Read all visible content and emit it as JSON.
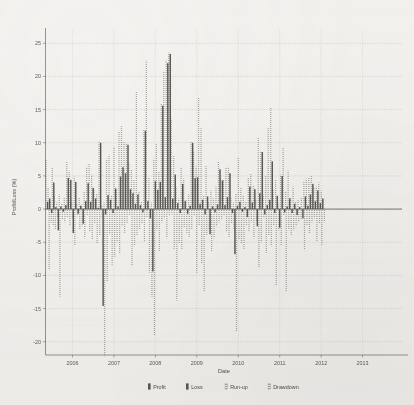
{
  "chart_data": {
    "type": "bar",
    "title": "",
    "xlabel": "Date",
    "ylabel": "Profit/Loss (%)",
    "ylim": [
      -22,
      27
    ],
    "yticks": [
      25,
      20,
      15,
      10,
      5,
      0,
      -5,
      -10,
      -15,
      -20
    ],
    "ytick_labels": [
      "25",
      "20",
      "15",
      "10",
      "5",
      "0",
      "-5",
      "-10",
      "-15",
      "-20"
    ],
    "xticks": [
      2006,
      2007,
      2008,
      2009,
      2010,
      2011,
      2012,
      2013
    ],
    "xtick_labels": [
      "2006",
      "2007",
      "2008",
      "2009",
      "2010",
      "2011",
      "2012",
      "2013"
    ],
    "xlim": [
      2005.35,
      2013.95
    ],
    "grid": true,
    "legend_position": "bottom",
    "legend": [
      {
        "name": "Profit",
        "style": "solid",
        "color": "#5a5855"
      },
      {
        "name": "Loss",
        "style": "solid",
        "color": "#5a5855"
      },
      {
        "name": "Run-up",
        "style": "hatched",
        "color": "#a8a6a2"
      },
      {
        "name": "Drawdown",
        "style": "hatched",
        "color": "#a8a6a2"
      }
    ],
    "series": [
      {
        "name": "Profit/Loss",
        "key": "pl"
      },
      {
        "name": "Run-up",
        "key": "runup"
      },
      {
        "name": "Drawdown",
        "key": "drawdown"
      }
    ],
    "points": [
      {
        "x": 2005.4,
        "pl": 1.1,
        "runup": 7.4,
        "drawdown": -9.2
      },
      {
        "x": 2005.45,
        "pl": 1.6,
        "runup": 3.2,
        "drawdown": -2.0
      },
      {
        "x": 2005.5,
        "pl": -0.6,
        "runup": 1.2,
        "drawdown": -2.4
      },
      {
        "x": 2005.55,
        "pl": 4.0,
        "runup": 6.2,
        "drawdown": -3.1
      },
      {
        "x": 2005.6,
        "pl": 0.3,
        "runup": 2.1,
        "drawdown": -1.3
      },
      {
        "x": 2005.66,
        "pl": -3.2,
        "runup": 1.0,
        "drawdown": -13.2
      },
      {
        "x": 2005.72,
        "pl": 0.4,
        "runup": 2.2,
        "drawdown": -1.6
      },
      {
        "x": 2005.78,
        "pl": -0.4,
        "runup": 0.8,
        "drawdown": -2.0
      },
      {
        "x": 2005.84,
        "pl": 0.6,
        "runup": 1.8,
        "drawdown": -1.2
      },
      {
        "x": 2005.9,
        "pl": 4.7,
        "runup": 7.2,
        "drawdown": -2.4
      },
      {
        "x": 2005.96,
        "pl": 4.4,
        "runup": 5.8,
        "drawdown": -1.4
      },
      {
        "x": 2006.02,
        "pl": -3.6,
        "runup": 1.3,
        "drawdown": -5.4
      },
      {
        "x": 2006.08,
        "pl": 4.1,
        "runup": 4.9,
        "drawdown": -1.1
      },
      {
        "x": 2006.14,
        "pl": -0.7,
        "runup": 0.9,
        "drawdown": -3.0
      },
      {
        "x": 2006.2,
        "pl": 0.5,
        "runup": 1.7,
        "drawdown": -2.6
      },
      {
        "x": 2006.26,
        "pl": -2.2,
        "runup": 0.7,
        "drawdown": -4.4
      },
      {
        "x": 2006.32,
        "pl": 1.2,
        "runup": 2.6,
        "drawdown": -1.0
      },
      {
        "x": 2006.38,
        "pl": 3.9,
        "runup": 6.4,
        "drawdown": -3.4
      },
      {
        "x": 2006.44,
        "pl": 1.1,
        "runup": 6.8,
        "drawdown": -4.6
      },
      {
        "x": 2006.5,
        "pl": 3.2,
        "runup": 5.2,
        "drawdown": -2.2
      },
      {
        "x": 2006.56,
        "pl": 1.6,
        "runup": 3.0,
        "drawdown": -5.2
      },
      {
        "x": 2006.62,
        "pl": 0.2,
        "runup": 2.4,
        "drawdown": -4.0
      },
      {
        "x": 2006.68,
        "pl": 10.0,
        "runup": 10.3,
        "drawdown": -1.4
      },
      {
        "x": 2006.74,
        "pl": -14.6,
        "runup": 0.6,
        "drawdown": -22.2
      },
      {
        "x": 2006.8,
        "pl": -0.8,
        "runup": 1.0,
        "drawdown": -11.0
      },
      {
        "x": 2006.86,
        "pl": 2.1,
        "runup": 7.6,
        "drawdown": -3.8
      },
      {
        "x": 2006.92,
        "pl": 1.4,
        "runup": 8.2,
        "drawdown": -8.4
      },
      {
        "x": 2006.98,
        "pl": -0.6,
        "runup": 2.0,
        "drawdown": -7.2
      },
      {
        "x": 2007.04,
        "pl": 3.1,
        "runup": 9.4,
        "drawdown": -5.0
      },
      {
        "x": 2007.1,
        "pl": 0.4,
        "runup": 3.1,
        "drawdown": -6.8
      },
      {
        "x": 2007.16,
        "pl": 4.9,
        "runup": 11.8,
        "drawdown": -2.6
      },
      {
        "x": 2007.22,
        "pl": 6.3,
        "runup": 12.6,
        "drawdown": -3.6
      },
      {
        "x": 2007.28,
        "pl": 5.4,
        "runup": 10.1,
        "drawdown": -2.2
      },
      {
        "x": 2007.34,
        "pl": 9.7,
        "runup": 10.0,
        "drawdown": -1.0
      },
      {
        "x": 2007.4,
        "pl": 3.0,
        "runup": 7.0,
        "drawdown": -8.6
      },
      {
        "x": 2007.46,
        "pl": 2.4,
        "runup": 6.0,
        "drawdown": -5.6
      },
      {
        "x": 2007.52,
        "pl": 0.8,
        "runup": 4.4,
        "drawdown": -4.0
      },
      {
        "x": 2007.58,
        "pl": 2.2,
        "runup": 17.8,
        "drawdown": -3.0
      },
      {
        "x": 2007.64,
        "pl": 0.6,
        "runup": 2.6,
        "drawdown": -2.2
      },
      {
        "x": 2007.7,
        "pl": -0.5,
        "runup": 1.2,
        "drawdown": -4.8
      },
      {
        "x": 2007.76,
        "pl": 11.8,
        "runup": 12.0,
        "drawdown": -1.2
      },
      {
        "x": 2007.82,
        "pl": 1.2,
        "runup": 22.4,
        "drawdown": -9.6
      },
      {
        "x": 2007.88,
        "pl": -1.4,
        "runup": 4.8,
        "drawdown": -13.2
      },
      {
        "x": 2007.94,
        "pl": -9.4,
        "runup": 1.0,
        "drawdown": -19.0
      },
      {
        "x": 2008.0,
        "pl": 4.2,
        "runup": 7.6,
        "drawdown": -3.2
      },
      {
        "x": 2008.06,
        "pl": 2.9,
        "runup": 9.8,
        "drawdown": -6.4
      },
      {
        "x": 2008.12,
        "pl": 4.1,
        "runup": 5.6,
        "drawdown": -2.0
      },
      {
        "x": 2008.18,
        "pl": 15.6,
        "runup": 16.0,
        "drawdown": -1.4
      },
      {
        "x": 2008.24,
        "pl": 1.8,
        "runup": 20.8,
        "drawdown": -4.4
      },
      {
        "x": 2008.3,
        "pl": 22.0,
        "runup": 22.4,
        "drawdown": -1.0
      },
      {
        "x": 2008.36,
        "pl": 23.4,
        "runup": 23.6,
        "drawdown": -0.8
      },
      {
        "x": 2008.42,
        "pl": 1.6,
        "runup": 13.6,
        "drawdown": -6.0
      },
      {
        "x": 2008.48,
        "pl": 5.2,
        "runup": 8.0,
        "drawdown": -13.8
      },
      {
        "x": 2008.54,
        "pl": 0.9,
        "runup": 3.4,
        "drawdown": -5.2
      },
      {
        "x": 2008.6,
        "pl": -0.6,
        "runup": 1.6,
        "drawdown": -6.0
      },
      {
        "x": 2008.66,
        "pl": 3.8,
        "runup": 6.2,
        "drawdown": -2.8
      },
      {
        "x": 2008.72,
        "pl": 1.2,
        "runup": 4.6,
        "drawdown": -3.6
      },
      {
        "x": 2008.78,
        "pl": -0.7,
        "runup": 1.4,
        "drawdown": -4.2
      },
      {
        "x": 2008.84,
        "pl": 0.5,
        "runup": 2.2,
        "drawdown": -3.0
      },
      {
        "x": 2008.9,
        "pl": 10.0,
        "runup": 10.2,
        "drawdown": -1.0
      },
      {
        "x": 2008.96,
        "pl": 4.7,
        "runup": 8.8,
        "drawdown": -9.6
      },
      {
        "x": 2009.02,
        "pl": 4.8,
        "runup": 6.4,
        "drawdown": -2.4
      },
      {
        "x": 2009.08,
        "pl": 0.8,
        "runup": 16.8,
        "drawdown": -8.2
      },
      {
        "x": 2009.14,
        "pl": 1.4,
        "runup": 12.2,
        "drawdown": -12.4
      },
      {
        "x": 2009.2,
        "pl": -0.8,
        "runup": 2.0,
        "drawdown": -4.0
      },
      {
        "x": 2009.26,
        "pl": 1.9,
        "runup": 6.6,
        "drawdown": -3.2
      },
      {
        "x": 2009.32,
        "pl": -3.8,
        "runup": 1.2,
        "drawdown": -6.4
      },
      {
        "x": 2009.38,
        "pl": 0.4,
        "runup": 2.8,
        "drawdown": -4.4
      },
      {
        "x": 2009.44,
        "pl": -0.5,
        "runup": 1.6,
        "drawdown": -2.6
      },
      {
        "x": 2009.5,
        "pl": 0.7,
        "runup": 3.4,
        "drawdown": -2.0
      },
      {
        "x": 2009.56,
        "pl": 6.0,
        "runup": 7.2,
        "drawdown": -1.6
      },
      {
        "x": 2009.62,
        "pl": 4.3,
        "runup": 4.6,
        "drawdown": -1.0
      },
      {
        "x": 2009.68,
        "pl": 0.6,
        "runup": 4.4,
        "drawdown": -3.4
      },
      {
        "x": 2009.74,
        "pl": 1.8,
        "runup": 6.2,
        "drawdown": -4.2
      },
      {
        "x": 2009.8,
        "pl": 5.4,
        "runup": 6.4,
        "drawdown": -2.2
      },
      {
        "x": 2009.86,
        "pl": -0.6,
        "runup": 1.8,
        "drawdown": -3.0
      },
      {
        "x": 2009.92,
        "pl": -6.8,
        "runup": 1.0,
        "drawdown": -18.4
      },
      {
        "x": 2009.98,
        "pl": 0.5,
        "runup": 2.4,
        "drawdown": -4.6
      },
      {
        "x": 2010.04,
        "pl": 1.1,
        "runup": 7.8,
        "drawdown": -5.2
      },
      {
        "x": 2010.1,
        "pl": -0.4,
        "runup": 3.2,
        "drawdown": -6.0
      },
      {
        "x": 2010.16,
        "pl": 0.3,
        "runup": 2.0,
        "drawdown": -2.4
      },
      {
        "x": 2010.22,
        "pl": -1.2,
        "runup": 1.2,
        "drawdown": -3.4
      },
      {
        "x": 2010.28,
        "pl": 3.4,
        "runup": 4.8,
        "drawdown": -2.0
      },
      {
        "x": 2010.34,
        "pl": 1.0,
        "runup": 5.4,
        "drawdown": -4.4
      },
      {
        "x": 2010.4,
        "pl": 3.0,
        "runup": 3.6,
        "drawdown": -1.8
      },
      {
        "x": 2010.46,
        "pl": -2.6,
        "runup": 1.4,
        "drawdown": -8.8
      },
      {
        "x": 2010.52,
        "pl": 2.4,
        "runup": 10.8,
        "drawdown": -5.0
      },
      {
        "x": 2010.58,
        "pl": 8.6,
        "runup": 8.8,
        "drawdown": -1.2
      },
      {
        "x": 2010.64,
        "pl": -0.8,
        "runup": 2.2,
        "drawdown": -6.6
      },
      {
        "x": 2010.7,
        "pl": 0.6,
        "runup": 5.0,
        "drawdown": -4.0
      },
      {
        "x": 2010.76,
        "pl": 1.4,
        "runup": 12.2,
        "drawdown": -5.6
      },
      {
        "x": 2010.82,
        "pl": 7.2,
        "runup": 15.4,
        "drawdown": -2.4
      },
      {
        "x": 2010.88,
        "pl": -0.6,
        "runup": 3.0,
        "drawdown": -11.6
      },
      {
        "x": 2010.94,
        "pl": 2.0,
        "runup": 4.4,
        "drawdown": -3.2
      },
      {
        "x": 2011.0,
        "pl": -2.8,
        "runup": 1.0,
        "drawdown": -5.4
      },
      {
        "x": 2011.06,
        "pl": 5.0,
        "runup": 5.2,
        "drawdown": -1.0
      },
      {
        "x": 2011.12,
        "pl": -0.5,
        "runup": 9.2,
        "drawdown": -12.4
      },
      {
        "x": 2011.18,
        "pl": 0.4,
        "runup": 2.6,
        "drawdown": -3.0
      },
      {
        "x": 2011.24,
        "pl": 1.6,
        "runup": 5.8,
        "drawdown": -4.0
      },
      {
        "x": 2011.3,
        "pl": -0.6,
        "runup": 1.8,
        "drawdown": -3.2
      },
      {
        "x": 2011.36,
        "pl": 0.8,
        "runup": 3.4,
        "drawdown": -2.6
      },
      {
        "x": 2011.42,
        "pl": -0.9,
        "runup": 1.2,
        "drawdown": -2.0
      },
      {
        "x": 2011.48,
        "pl": 0.3,
        "runup": 1.4,
        "drawdown": -1.6
      },
      {
        "x": 2011.56,
        "pl": -1.4,
        "runup": 1.8,
        "drawdown": -6.2
      },
      {
        "x": 2011.62,
        "pl": 1.9,
        "runup": 4.2,
        "drawdown": -2.4
      },
      {
        "x": 2011.68,
        "pl": 0.5,
        "runup": 4.6,
        "drawdown": -3.6
      },
      {
        "x": 2011.74,
        "pl": 2.2,
        "runup": 4.8,
        "drawdown": -2.0
      },
      {
        "x": 2011.8,
        "pl": 3.8,
        "runup": 5.0,
        "drawdown": -1.4
      },
      {
        "x": 2011.86,
        "pl": 1.2,
        "runup": 3.2,
        "drawdown": -4.8
      },
      {
        "x": 2011.92,
        "pl": 2.8,
        "runup": 3.4,
        "drawdown": -2.2
      },
      {
        "x": 2011.98,
        "pl": 0.9,
        "runup": 4.0,
        "drawdown": -5.4
      },
      {
        "x": 2012.04,
        "pl": 1.6,
        "runup": 2.8,
        "drawdown": -2.0
      }
    ]
  },
  "xaxis": {
    "label": "Date"
  },
  "yaxis": {
    "label": "Profit/Loss (%)"
  },
  "legend": {
    "items": [
      {
        "label": "Profit",
        "icon": "solid-bar-icon"
      },
      {
        "label": "Loss",
        "icon": "solid-bar-icon"
      },
      {
        "label": "Run-up",
        "icon": "hatched-bar-icon"
      },
      {
        "label": "Drawdown",
        "icon": "hatched-bar-icon"
      }
    ]
  }
}
